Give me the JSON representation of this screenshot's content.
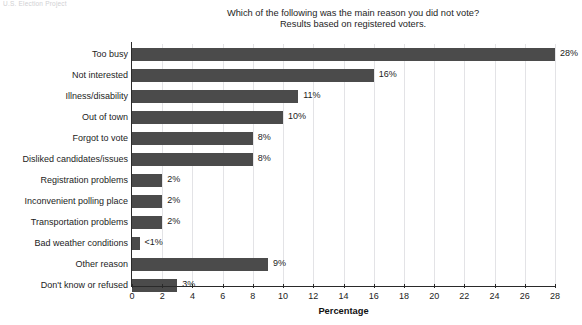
{
  "running_head": "U.S. Election Project",
  "title": {
    "line1": "Which of the following was the main reason you did not vote?",
    "line2": "Results based on registered voters."
  },
  "axis": {
    "x_title": "Percentage",
    "tick_labels": [
      "0",
      "2",
      "4",
      "6",
      "8",
      "10",
      "12",
      "14",
      "16",
      "18",
      "20",
      "22",
      "24",
      "26",
      "28"
    ]
  },
  "colors": {
    "bar": "#4b4b4b",
    "axis": "#2a2a2a",
    "grid": "#e3e3e6",
    "text": "#1c1c1c"
  },
  "chart_data": {
    "type": "bar",
    "orientation": "horizontal",
    "title": "Which of the following was the main reason you did not vote? Results based on registered voters.",
    "xlabel": "Percentage",
    "ylabel": "",
    "xlim": [
      0,
      28
    ],
    "xticks": [
      0,
      2,
      4,
      6,
      8,
      10,
      12,
      14,
      16,
      18,
      20,
      22,
      24,
      26,
      28
    ],
    "grid": "vertical",
    "legend": "none",
    "categories": [
      "Too busy",
      "Not interested",
      "Illness/disability",
      "Out of town",
      "Forgot to vote",
      "Disliked candidates/issues",
      "Registration problems",
      "Inconvenient polling place",
      "Transportation problems",
      "Bad weather conditions",
      "Other reason",
      "Don't know or refused"
    ],
    "values": [
      28,
      16,
      11,
      10,
      8,
      8,
      2,
      2,
      2,
      0.5,
      9,
      3
    ],
    "value_labels": [
      "28%",
      "16%",
      "11%",
      "10%",
      "8%",
      "8%",
      "2%",
      "2%",
      "2%",
      "<1%",
      "9%",
      "3%"
    ]
  }
}
